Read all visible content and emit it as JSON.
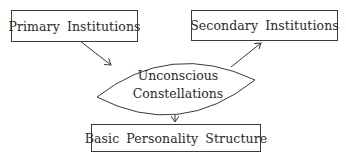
{
  "diagram": {
    "nodes": {
      "primary": {
        "label": "Primary Institutions",
        "shape": "rectangle"
      },
      "secondary": {
        "label": "Secondary Institutions",
        "shape": "rectangle"
      },
      "center": {
        "line1": "Unconscious",
        "line2": "Constellations",
        "shape": "lens"
      },
      "basic": {
        "label": "Basic Personality Structure",
        "shape": "rectangle"
      }
    },
    "edges": [
      {
        "from": "Primary Institutions",
        "to": "Unconscious Constellations"
      },
      {
        "from": "Unconscious Constellations",
        "to": "Secondary Institutions"
      },
      {
        "from": "Unconscious Constellations",
        "to": "Basic Personality Structure"
      }
    ],
    "colors": {
      "stroke": "#3a3a3a",
      "text": "#2a2a2a",
      "background": "#ffffff"
    }
  }
}
